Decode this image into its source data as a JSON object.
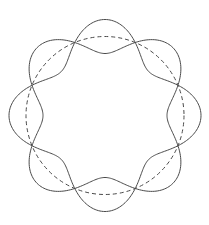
{
  "diagram": {
    "center": [
      105,
      115.5
    ],
    "base_radius": 79,
    "amplitude": 17,
    "lobes": 4,
    "curves": [
      {
        "name": "curve-a",
        "sign": 1,
        "style": "solid"
      },
      {
        "name": "curve-b",
        "sign": -1,
        "style": "solid"
      }
    ],
    "reference_circle": {
      "style": "dashed"
    },
    "colors": {
      "stroke": "#4a4a4a",
      "dashed": "#4a4a4a",
      "background": "#ffffff"
    }
  }
}
